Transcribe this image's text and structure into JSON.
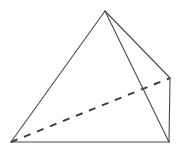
{
  "figure": {
    "name": "square-pyramid-wireframe",
    "background_color": "#ffffff",
    "canvas": {
      "width": 179,
      "height": 151
    },
    "stroke": {
      "visible_edge_color": "#4a4a4a",
      "visible_edge_width": 1.1,
      "hidden_edge_color": "#3c3c3c",
      "hidden_edge_width": 1.9,
      "hidden_edge_dash": "7 7"
    },
    "vertices": {
      "apex": {
        "label": "apex",
        "x": 105,
        "y": 11
      },
      "base_front_left": {
        "label": "base-front-left",
        "x": 11,
        "y": 142
      },
      "base_front_right": {
        "label": "base-front-right",
        "x": 169,
        "y": 142
      },
      "base_back_right": {
        "label": "base-back-right",
        "x": 170,
        "y": 78
      }
    },
    "edges": [
      {
        "name": "apex-to-front-left",
        "from": "apex",
        "to": "base_front_left",
        "style": "solid",
        "path": "M 105 11 L 11 142"
      },
      {
        "name": "apex-to-front-right",
        "from": "apex",
        "to": "base_front_right",
        "style": "solid",
        "path": "M 105 11 L 169 142"
      },
      {
        "name": "apex-to-back-right",
        "from": "apex",
        "to": "base_back_right",
        "style": "solid",
        "path": "M 105 11 L 170 78"
      },
      {
        "name": "base-front",
        "from": "base_front_left",
        "to": "base_front_right",
        "style": "solid",
        "path": "M 11 142 L 169 142"
      },
      {
        "name": "base-right",
        "from": "base_front_right",
        "to": "base_back_right",
        "style": "solid",
        "path": "M 169 142 L 170 78"
      },
      {
        "name": "base-hidden-diagonal",
        "from": "base_front_left",
        "to": "base_back_right",
        "style": "dashed",
        "path": "M 11 142 L 170 78"
      }
    ],
    "faces": [
      {
        "name": "front-face",
        "points": "105,11 11,142 169,142"
      },
      {
        "name": "right-side-face",
        "points": "105,11 169,142 170,78"
      }
    ],
    "labels": []
  }
}
